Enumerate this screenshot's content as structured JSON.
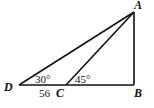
{
  "diagram": {
    "type": "geometry",
    "points": {
      "A": {
        "label": "A",
        "x": 134,
        "y": 12
      },
      "B": {
        "label": "B",
        "x": 134,
        "y": 85
      },
      "C": {
        "label": "C",
        "x": 66,
        "y": 85
      },
      "D": {
        "label": "D",
        "x": 19,
        "y": 85
      }
    },
    "segments": [
      [
        "D",
        "B"
      ],
      [
        "A",
        "B"
      ],
      [
        "A",
        "D"
      ],
      [
        "A",
        "C"
      ]
    ],
    "angles": {
      "D": "30°",
      "ACB": "45°"
    },
    "lengths": {
      "DC": "56"
    },
    "line_color": "#111111"
  }
}
